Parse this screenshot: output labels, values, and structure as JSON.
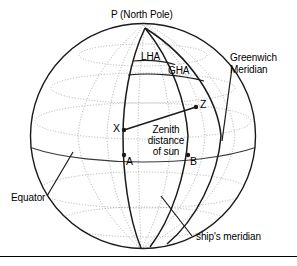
{
  "figure": {
    "type": "celestial-navigation-globe-diagram",
    "title_text": "",
    "colors": {
      "outline": "#1a1a1a",
      "graticule": "#8a8a8a",
      "meridian": "#1a1a1a",
      "equator": "#3a3a3a",
      "text": "#000000",
      "background": "#ffffff",
      "rule": "#000000"
    },
    "globe": {
      "center_x": 143,
      "center_y": 136,
      "radius": 113,
      "pole_x": 145,
      "pole_y": 28
    }
  },
  "labels": {
    "pole": "P (North Pole)",
    "lha": "LHA",
    "gha": "GHA",
    "greenwich_meridian_line1": "Greenwich",
    "greenwich_meridian_line2": "Meridian",
    "zenith_line1": "Zenith",
    "zenith_line2": "distance",
    "zenith_line3": "of sun",
    "point_x": "X",
    "point_z": "Z",
    "point_a": "A",
    "point_b": "B",
    "equator": "Equator",
    "ships_meridian": "ship's meridian"
  }
}
